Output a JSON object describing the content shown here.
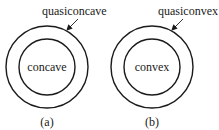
{
  "panels": [
    {
      "outer_label": "quasiconcave",
      "inner_label": "concave",
      "caption": "(a)"
    },
    {
      "outer_label": "quasiconvex",
      "inner_label": "convex",
      "caption": "(b)"
    }
  ],
  "colors": {
    "stroke": "#1a1a1a",
    "background": "#ffffff"
  }
}
